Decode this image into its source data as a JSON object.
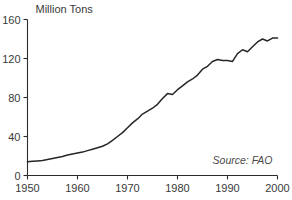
{
  "chart_data": {
    "type": "line",
    "title": "Million Tons",
    "xlabel": "",
    "ylabel": "Million Tons",
    "xlim": [
      1950,
      2000
    ],
    "ylim": [
      0,
      160
    ],
    "grid": false,
    "legend": null,
    "annotation": "Source: FAO",
    "line_color": "#262626",
    "axis_color": "#2b2b2b",
    "text_color": "#3a3a3a",
    "x_ticks": [
      1950,
      1960,
      1970,
      1980,
      1990,
      2000
    ],
    "x_tick_labels": [
      "1950",
      "1960",
      "1970",
      "1980",
      "1990",
      "2000"
    ],
    "y_ticks": [
      0,
      40,
      80,
      120,
      160
    ],
    "y_tick_labels": [
      "0",
      "40",
      "80",
      "120",
      "160"
    ],
    "x": [
      1950,
      1951,
      1952,
      1953,
      1954,
      1955,
      1956,
      1957,
      1958,
      1959,
      1960,
      1961,
      1962,
      1963,
      1964,
      1965,
      1966,
      1967,
      1968,
      1969,
      1970,
      1971,
      1972,
      1973,
      1974,
      1975,
      1976,
      1977,
      1978,
      1979,
      1980,
      1981,
      1982,
      1983,
      1984,
      1985,
      1986,
      1987,
      1988,
      1989,
      1990,
      1991,
      1992,
      1993,
      1994,
      1995,
      1996,
      1997,
      1998,
      1999,
      2000
    ],
    "values": [
      14,
      14.5,
      15,
      15.5,
      16.5,
      17.5,
      18.5,
      19.5,
      21,
      22,
      23,
      24,
      25.5,
      27,
      28.5,
      30,
      32.5,
      36,
      40,
      44,
      49,
      54,
      58,
      63,
      66,
      69,
      73,
      79,
      84,
      83,
      88,
      92,
      96,
      99,
      103,
      109,
      112,
      117,
      119,
      118,
      118,
      117,
      125,
      129,
      127,
      132,
      137,
      140,
      138,
      141,
      141
    ],
    "series": [
      {
        "name": "World fish catch",
        "values": [
          14,
          14.5,
          15,
          15.5,
          16.5,
          17.5,
          18.5,
          19.5,
          21,
          22,
          23,
          24,
          25.5,
          27,
          28.5,
          30,
          32.5,
          36,
          40,
          44,
          49,
          54,
          58,
          63,
          66,
          69,
          73,
          79,
          84,
          83,
          88,
          92,
          96,
          99,
          103,
          109,
          112,
          117,
          119,
          118,
          118,
          117,
          125,
          129,
          127,
          132,
          137,
          140,
          138,
          141,
          141
        ]
      }
    ]
  }
}
